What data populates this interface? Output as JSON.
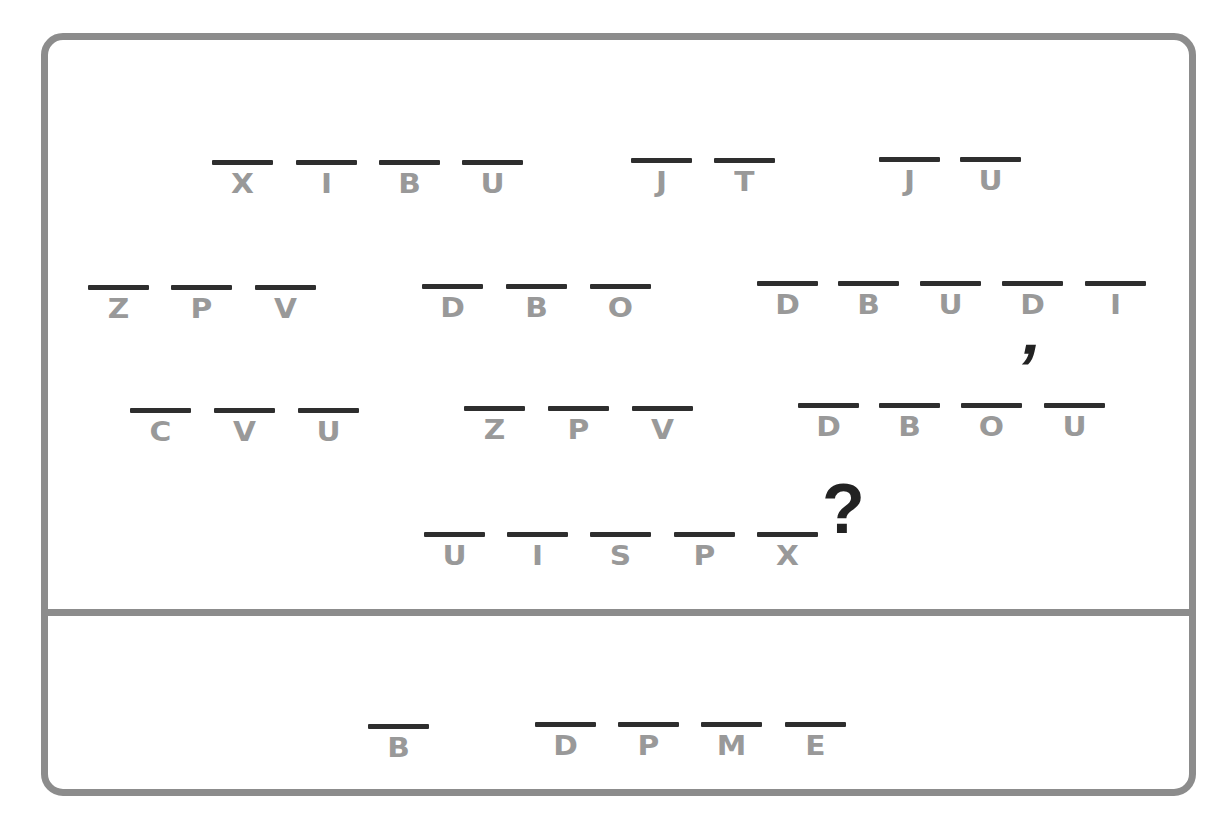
{
  "puzzle": {
    "type": "letter-shift cipher",
    "colors": {
      "frame": "#8c8c8c",
      "bar": "#2e2e2e",
      "letter": "#999999",
      "punctuation": "#222222"
    },
    "encoded_lines": [
      {
        "words": [
          {
            "letters": [
              "X",
              "I",
              "B",
              "U"
            ],
            "x": [
              212,
              296,
              379,
              462
            ],
            "y": 160
          },
          {
            "letters": [
              "J",
              "T"
            ],
            "x": [
              631,
              714
            ],
            "y": 158
          },
          {
            "letters": [
              "J",
              "U"
            ],
            "x": [
              879,
              960
            ],
            "y": 157
          }
        ]
      },
      {
        "words": [
          {
            "letters": [
              "Z",
              "P",
              "V"
            ],
            "x": [
              88,
              171,
              255
            ],
            "y": 285
          },
          {
            "letters": [
              "D",
              "B",
              "O"
            ],
            "x": [
              422,
              506,
              590
            ],
            "y": 284
          },
          {
            "letters": [
              "D",
              "B",
              "U",
              "D",
              "I"
            ],
            "x": [
              757,
              838,
              920,
              1002,
              1085
            ],
            "y": 281
          }
        ]
      },
      {
        "words": [
          {
            "letters": [
              "C",
              "V",
              "U"
            ],
            "x": [
              130,
              214,
              298
            ],
            "y": 408
          },
          {
            "letters": [
              "Z",
              "P",
              "V"
            ],
            "x": [
              464,
              548,
              632
            ],
            "y": 406
          },
          {
            "letters": [
              "D",
              "B",
              "O",
              "U"
            ],
            "x": [
              798,
              879,
              961,
              1044
            ],
            "y": 403
          }
        ]
      },
      {
        "words": [
          {
            "letters": [
              "U",
              "I",
              "S",
              "P",
              "X"
            ],
            "x": [
              424,
              507,
              590,
              674,
              757
            ],
            "y": 532
          }
        ]
      }
    ],
    "apostrophe": "’",
    "question_mark": "?",
    "answer_area": {
      "words": [
        {
          "letters": [
            "B"
          ],
          "x": [
            368
          ],
          "y": 724
        },
        {
          "letters": [
            "D",
            "P",
            "M",
            "E"
          ],
          "x": [
            535,
            618,
            701,
            785
          ],
          "y": 722
        }
      ]
    }
  }
}
